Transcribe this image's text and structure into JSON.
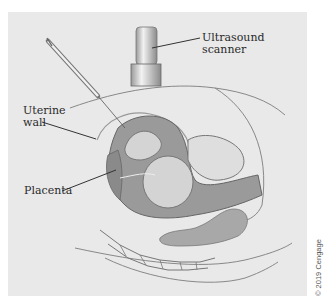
{
  "figure": {
    "labels": {
      "scanner": [
        "Ultrasound",
        "scanner"
      ],
      "uterine_wall": [
        "Uterine",
        "wall"
      ],
      "placenta": "Placenta"
    },
    "credit": "© 2019 Cengage",
    "colors": {
      "background": "#e9e9e9",
      "amniotic_fluid": "#9a9a9a",
      "fetus": "#d4d4d4",
      "outline": "#555555",
      "text": "#2a2a2a"
    },
    "icons": [
      "syringe-icon",
      "ultrasound-scanner-icon"
    ]
  }
}
